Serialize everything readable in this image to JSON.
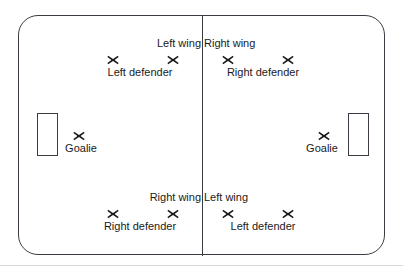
{
  "diagram": {
    "type": "rink-formation-diagram",
    "marker_glyph": "x-marker",
    "colors": {
      "rink_border": "#3b3b43",
      "center_line": "#3b3b43",
      "marker": "#1a1a1a",
      "text": "#1a1a1a",
      "background": "#ffffff",
      "footer_rule": "#d8d8d8"
    },
    "rink": {
      "left_zone_name": "Left zone",
      "right_zone_name": "Right zone",
      "goal_left_name": "Left goal net",
      "goal_right_name": "Right goal net",
      "center_line_name": "Center line"
    },
    "players": [
      {
        "label": "Left defender",
        "zone": "left",
        "x": 113,
        "y": 60,
        "label_pos": "below"
      },
      {
        "label": "Left wing",
        "zone": "left",
        "x": 173,
        "y": 60,
        "label_pos": "above"
      },
      {
        "label": "Goalie",
        "zone": "left",
        "x": 79,
        "y": 136,
        "label_pos": "below"
      },
      {
        "label": "Right defender",
        "zone": "left",
        "x": 113,
        "y": 214,
        "label_pos": "below"
      },
      {
        "label": "Right wing",
        "zone": "left",
        "x": 173,
        "y": 214,
        "label_pos": "above"
      },
      {
        "label": "Right wing",
        "zone": "right",
        "x": 228,
        "y": 60,
        "label_pos": "above"
      },
      {
        "label": "Right defender",
        "zone": "right",
        "x": 288,
        "y": 60,
        "label_pos": "below"
      },
      {
        "label": "Goalie",
        "zone": "right",
        "x": 324,
        "y": 136,
        "label_pos": "below"
      },
      {
        "label": "Left wing",
        "zone": "right",
        "x": 228,
        "y": 214,
        "label_pos": "above"
      },
      {
        "label": "Left defender",
        "zone": "right",
        "x": 288,
        "y": 214,
        "label_pos": "below"
      }
    ]
  }
}
